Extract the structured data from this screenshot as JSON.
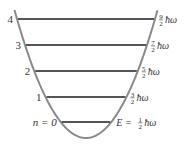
{
  "colors": {
    "well": "#8a8a8a",
    "levels": "#555555",
    "text": "#333333"
  },
  "potential": {
    "shape": "parabola",
    "vertex": [
      86,
      138
    ],
    "k": 0.025
  },
  "levels": [
    {
      "n_label": "4",
      "num": "9",
      "den": "2",
      "suffix": "ħω",
      "prefix": "",
      "y": 19
    },
    {
      "n_label": "3",
      "num": "7",
      "den": "2",
      "suffix": "ħω",
      "prefix": "",
      "y": 45
    },
    {
      "n_label": "2",
      "num": "5",
      "den": "2",
      "suffix": "ħω",
      "prefix": "",
      "y": 71
    },
    {
      "n_label": "1",
      "num": "3",
      "den": "2",
      "suffix": "ħω",
      "prefix": "",
      "y": 97
    },
    {
      "n_label": "n = 0",
      "num": "1",
      "den": "2",
      "suffix": "ħω",
      "prefix": "E =",
      "y": 122
    }
  ]
}
